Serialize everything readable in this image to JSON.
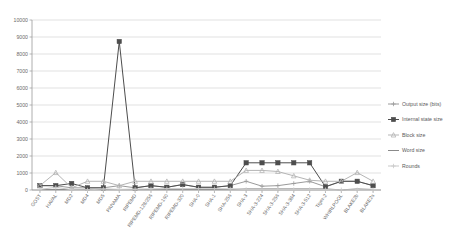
{
  "chart_data": {
    "type": "line",
    "title": "",
    "subtitle": "",
    "xlabel": "",
    "ylabel": "",
    "ylim": [
      0,
      10000
    ],
    "yticks": [
      0,
      1000,
      2000,
      3000,
      4000,
      5000,
      6000,
      7000,
      8000,
      9000,
      10000
    ],
    "ytick_labels": [
      "0",
      "1000",
      "2000",
      "3000",
      "4000",
      "5000",
      "6000",
      "7000",
      "8000",
      "9000",
      "10000"
    ],
    "grid": true,
    "legend_position": "right",
    "categories": [
      "GOST",
      "HAVAL",
      "MD2",
      "MD4",
      "MD5",
      "PANAMA",
      "RIPEMD",
      "RIPEMD-128/256",
      "RIPEMD-160",
      "RIPEMD-320",
      "SHA-0",
      "SHA-1",
      "SHA-256",
      "SHA-3",
      "SHA-3-224",
      "SHA-3-256",
      "SHA-3-384",
      "SHA-3-512",
      "Tiger-2",
      "WHIRLPOOL",
      "BLAKE2b",
      "BLAKE2s"
    ],
    "series": [
      {
        "name": "Output size (bits)",
        "color": "#9a9a9a",
        "marker": "plus",
        "values": [
          256,
          256,
          128,
          128,
          128,
          256,
          128,
          256,
          160,
          320,
          160,
          160,
          256,
          512,
          224,
          256,
          384,
          512,
          192,
          512,
          512,
          256
        ]
      },
      {
        "name": "Internal state size",
        "color": "#4d4d4d",
        "marker": "square",
        "values": [
          256,
          256,
          384,
          128,
          128,
          8736,
          128,
          256,
          160,
          320,
          160,
          160,
          256,
          1600,
          1600,
          1600,
          1600,
          1600,
          192,
          512,
          512,
          256
        ]
      },
      {
        "name": "Block size",
        "color": "#b5b5b5",
        "marker": "triangle",
        "values": [
          256,
          1024,
          128,
          512,
          512,
          256,
          512,
          512,
          512,
          512,
          512,
          512,
          512,
          1152,
          1152,
          1088,
          832,
          576,
          512,
          512,
          1024,
          512
        ]
      },
      {
        "name": "Word size",
        "color": "#8a8a8a",
        "marker": "none",
        "values": [
          32,
          32,
          32,
          32,
          32,
          32,
          32,
          32,
          32,
          32,
          32,
          32,
          32,
          64,
          64,
          64,
          64,
          64,
          64,
          8,
          64,
          32
        ]
      },
      {
        "name": "Rounds",
        "color": "#c9c9c9",
        "marker": "plus",
        "values": [
          32,
          160,
          18,
          3,
          64,
          32,
          48,
          64,
          80,
          80,
          80,
          80,
          64,
          24,
          24,
          24,
          24,
          24,
          24,
          10,
          12,
          10
        ]
      }
    ]
  },
  "legend": {
    "items": [
      {
        "label": "Output size (bits)"
      },
      {
        "label": "Internal state size"
      },
      {
        "label": "Block size"
      },
      {
        "label": "Word size"
      },
      {
        "label": "Rounds"
      }
    ]
  }
}
